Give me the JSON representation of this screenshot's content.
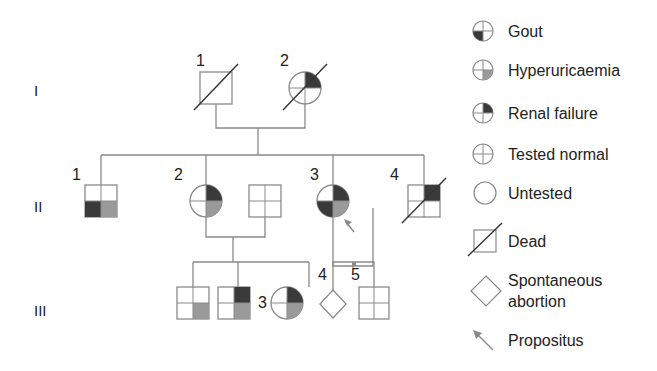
{
  "colors": {
    "line": "#8a8a8a",
    "gout": "#3a3a3a",
    "hyperuricaemia": "#9a9a9a",
    "renal_failure": "#3a3a3a",
    "arrow": "#8a8a8a"
  },
  "generations": [
    "I",
    "II",
    "III"
  ],
  "individuals": {
    "I_1": {
      "label": "1",
      "sex": "male",
      "status": "dead",
      "phenotype": "untested"
    },
    "I_2": {
      "label": "2",
      "sex": "female",
      "status": "dead",
      "phenotype": [
        "renal failure"
      ]
    },
    "II_1": {
      "label": "1",
      "sex": "male",
      "phenotype": [
        "gout",
        "hyperuricaemia"
      ]
    },
    "II_2": {
      "label": "2",
      "sex": "female",
      "phenotype": [
        "renal failure",
        "hyperuricaemia"
      ]
    },
    "II_2_spouse": {
      "label": "",
      "sex": "male",
      "phenotype": "tested normal"
    },
    "II_3": {
      "label": "3",
      "sex": "female",
      "propositus": true,
      "phenotype": [
        "renal failure",
        "gout",
        "hyperuricaemia"
      ]
    },
    "II_4": {
      "label": "4",
      "sex": "male",
      "status": "dead",
      "phenotype": [
        "renal failure"
      ]
    },
    "III_1": {
      "label": "1",
      "sex": "male",
      "phenotype": [
        "hyperuricaemia"
      ]
    },
    "III_2": {
      "label": "2",
      "sex": "male",
      "phenotype": [
        "renal failure",
        "hyperuricaemia"
      ]
    },
    "III_3": {
      "label": "3",
      "sex": "female",
      "phenotype": [
        "renal failure",
        "hyperuricaemia"
      ]
    },
    "III_4": {
      "label": "4",
      "type": "spontaneous abortion"
    },
    "III_5": {
      "label": "5",
      "sex": "male",
      "phenotype": "tested normal"
    }
  },
  "legend": {
    "gout": "Gout",
    "hyperuricaemia": "Hyperuricaemia",
    "renal_failure": "Renal failure",
    "tested_normal": "Tested normal",
    "untested": "Untested",
    "dead": "Dead",
    "abortion_line1": "Spontaneous",
    "abortion_line2": "abortion",
    "propositus": "Propositus"
  }
}
